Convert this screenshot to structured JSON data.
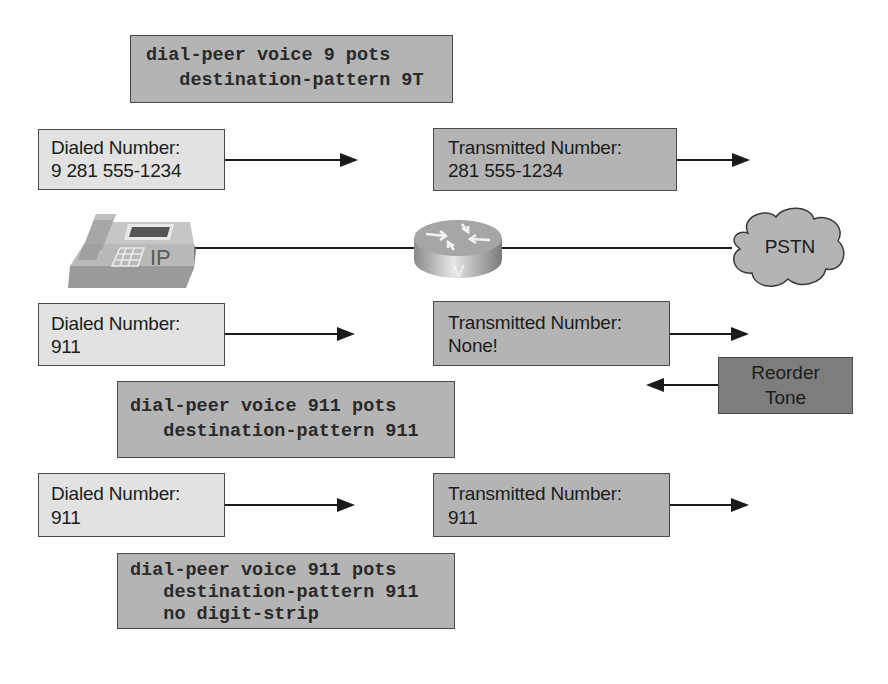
{
  "scenario1": {
    "config": {
      "line1": "dial-peer voice 9 pots",
      "line2": "   destination-pattern 9T"
    },
    "dialed": {
      "title": "Dialed Number:",
      "value": "9 281 555-1234"
    },
    "transmitted": {
      "title": "Transmitted Number:",
      "value": "281 555-1234"
    }
  },
  "topology": {
    "phone_label": "IP",
    "router_label": "V",
    "cloud_label": "PSTN"
  },
  "scenario2": {
    "dialed": {
      "title": "Dialed Number:",
      "value": "911"
    },
    "transmitted": {
      "title": "Transmitted Number:",
      "value": "None!"
    },
    "reorder": {
      "line1": "Reorder",
      "line2": "Tone"
    },
    "config": {
      "line1": "dial-peer voice 911 pots",
      "line2": "   destination-pattern 911"
    }
  },
  "scenario3": {
    "dialed": {
      "title": "Dialed Number:",
      "value": "911"
    },
    "transmitted": {
      "title": "Transmitted Number:",
      "value": "911"
    },
    "config": {
      "line1": "dial-peer voice 911 pots",
      "line2": "   destination-pattern 911",
      "line3": "   no digit-strip"
    }
  },
  "colors": {
    "dialed_box": "#e2e2e2",
    "transmitted_box": "#b4b4b4",
    "config_box": "#b4b4b4",
    "reorder_box": "#7d7d7d"
  }
}
